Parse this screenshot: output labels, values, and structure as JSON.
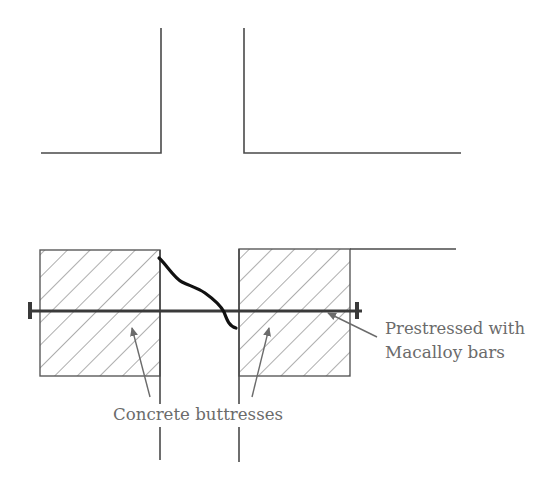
{
  "diagram": {
    "labels": {
      "buttresses": "Concrete buttresses",
      "prestress_line1": "Prestressed with",
      "prestress_line2": "Macalloy bars"
    },
    "elements": [
      "wall-outline-top-left",
      "wall-outline-top-right",
      "concrete-buttress-left",
      "concrete-buttress-right",
      "macalloy-bar",
      "anchor-plate-left",
      "anchor-plate-right",
      "crack-line"
    ],
    "colors": {
      "line": "#4a4a4a",
      "crack": "#111111",
      "label": "#6b6b6b",
      "hatch": "#6a6a6a"
    }
  }
}
